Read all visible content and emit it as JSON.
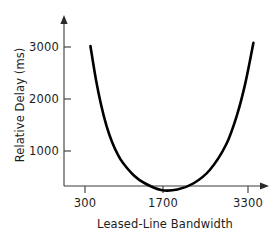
{
  "chart_data": {
    "type": "line",
    "title": "",
    "xlabel": "Leased-Line Bandwidth",
    "ylabel": "Relative Delay (ms)",
    "xlim": [
      100,
      3600
    ],
    "ylim": [
      0,
      3300
    ],
    "grid": false,
    "legend": null,
    "xticks": [
      {
        "value": 300,
        "label": "300"
      },
      {
        "value": 1700,
        "label": "1700"
      },
      {
        "value": 3300,
        "label": "3300"
      }
    ],
    "yticks": [
      {
        "value": 1000,
        "label": "1000"
      },
      {
        "value": 2000,
        "label": "2000"
      },
      {
        "value": 3000,
        "label": "3000"
      }
    ],
    "series": [
      {
        "name": "Relative Delay",
        "x": [
          400,
          500,
          600,
          700,
          800,
          900,
          1000,
          1200,
          1400,
          1700,
          2000,
          2300,
          2600,
          2900,
          3100,
          3250,
          3400
        ],
        "y": [
          3020,
          2380,
          1870,
          1470,
          1170,
          940,
          770,
          530,
          380,
          250,
          260,
          380,
          640,
          1130,
          1700,
          2300,
          3080
        ]
      }
    ],
    "annotations": []
  },
  "axes": {
    "y_axis_name": "vertical-axis",
    "x_axis_name": "horizontal-axis"
  }
}
